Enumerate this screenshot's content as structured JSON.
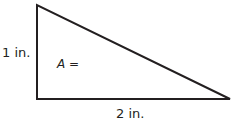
{
  "diagram": {
    "type": "right-triangle",
    "labels": {
      "left_side": "1 in.",
      "bottom_side": "2 in.",
      "area_variable": "A",
      "area_equals": " ="
    },
    "colors": {
      "stroke": "#231f20",
      "fill": "#ffffff"
    }
  }
}
